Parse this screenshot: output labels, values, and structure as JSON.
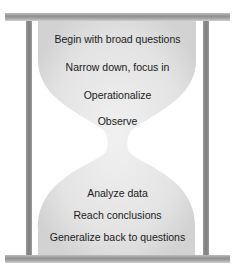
{
  "diagram": {
    "type": "hourglass",
    "top_steps": [
      "Begin with broad questions",
      "Narrow down, focus in",
      "Operationalize",
      "Observe"
    ],
    "bottom_steps": [
      "Analyze data",
      "Reach conclusions",
      "Generalize back to questions"
    ],
    "colors": {
      "frame": "#8f8f8f",
      "glass": "#e2e2e2",
      "text": "#1a1a1a"
    }
  }
}
